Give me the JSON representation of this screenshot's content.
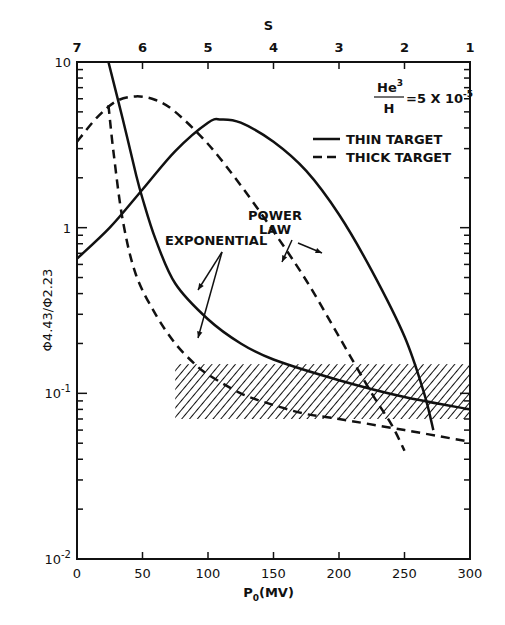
{
  "chart_data": {
    "type": "line",
    "title": "",
    "xlabel": "P0(MV)",
    "ylabel": "Φ4.43 / Φ2.23",
    "top_xlabel": "S",
    "yscale": "log",
    "xlim": [
      0,
      300
    ],
    "ylim": [
      0.01,
      10
    ],
    "x_ticks": [
      "0",
      "50",
      "100",
      "150",
      "200",
      "250",
      "300"
    ],
    "y_ticks": [
      "10-2",
      "10-1",
      "1",
      "10"
    ],
    "top_ticks": [
      "7",
      "6",
      "5",
      "4",
      "3",
      "2",
      "1"
    ],
    "annotation_ratio": "He3/H = 5×10-5",
    "legend": [
      {
        "label": "THIN TARGET",
        "style": "solid"
      },
      {
        "label": "THICK TARGET",
        "style": "dashed"
      }
    ],
    "annotations": [
      "EXPONENTIAL",
      "POWER LAW"
    ],
    "shaded_band": {
      "x": [
        75,
        300
      ],
      "y": [
        0.07,
        0.15
      ],
      "style": "hatched"
    },
    "series": [
      {
        "name": "Thin target, exponential",
        "style": "solid",
        "x": [
          24,
          35,
          45,
          50,
          60,
          75,
          100,
          125,
          150,
          200,
          250,
          300
        ],
        "y": [
          10,
          4.5,
          2.1,
          1.5,
          0.85,
          0.46,
          0.28,
          0.2,
          0.16,
          0.12,
          0.095,
          0.08
        ]
      },
      {
        "name": "Thick target, exponential",
        "style": "dashed",
        "x": [
          24,
          28,
          35,
          45,
          60,
          75,
          90,
          100,
          125,
          150,
          175,
          200,
          250,
          300
        ],
        "y": [
          5.5,
          2.8,
          1.1,
          0.52,
          0.3,
          0.2,
          0.15,
          0.13,
          0.1,
          0.085,
          0.075,
          0.07,
          0.06,
          0.051
        ]
      },
      {
        "name": "Thin target, power law",
        "style": "solid",
        "x": [
          0,
          25,
          50,
          75,
          100,
          110,
          125,
          150,
          175,
          200,
          225,
          250,
          265,
          272
        ],
        "y": [
          0.65,
          1.0,
          1.7,
          2.9,
          4.3,
          4.5,
          4.3,
          3.3,
          2.2,
          1.2,
          0.55,
          0.22,
          0.1,
          0.06
        ]
      },
      {
        "name": "Thick target, power law",
        "style": "dashed",
        "x": [
          0,
          15,
          30,
          45,
          60,
          75,
          100,
          125,
          150,
          175,
          200,
          225,
          240,
          250
        ],
        "y": [
          3.3,
          4.6,
          5.8,
          6.2,
          5.9,
          5.0,
          3.2,
          1.8,
          0.95,
          0.48,
          0.22,
          0.1,
          0.065,
          0.045
        ]
      }
    ]
  },
  "text": {
    "top_axis_label": "S",
    "x_axis_label_main": "P",
    "x_axis_label_sub": "0",
    "x_axis_label_rest": "(MV)",
    "y_axis_label": "Φ4.43/Φ2.23",
    "ratio_num": "He",
    "ratio_sup": "3",
    "ratio_den": "H",
    "ratio_value": "=5 X 10",
    "ratio_exp": "-5",
    "legend_thin": "THIN TARGET",
    "legend_thick": "THICK TARGET",
    "ann_exponential": "EXPONENTIAL",
    "ann_power_1": "POWER",
    "ann_power_2": "LAW",
    "header": "Nuclear Gamma-Ray Line Ratios"
  }
}
